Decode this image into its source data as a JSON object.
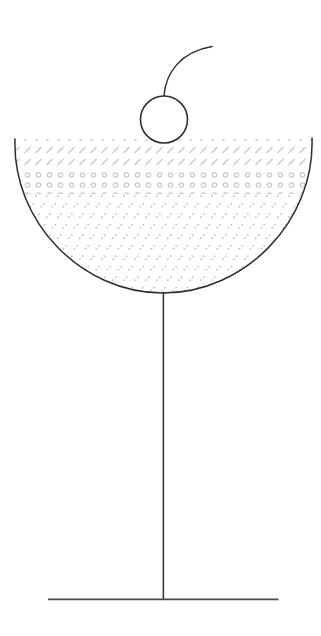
{
  "canvas": {
    "background": "#ffffff",
    "width_px": 321,
    "height_px": 636
  },
  "illustration": {
    "name": "cocktail-coupe-glass-with-cherry",
    "colors": {
      "outline": "#2e2e2e",
      "foot": "#4a4a4a",
      "hatch": "#c6c6c6",
      "cherry_fill": "#ffffff"
    },
    "parts": {
      "cherry": "cherry",
      "cherry_stem": "cherry stem",
      "bowl": "coupe bowl",
      "stem": "glass stem",
      "foot": "glass foot"
    },
    "fill_layers": [
      {
        "name": "top-layer",
        "hatch": "diagonal-slash",
        "rows": 2
      },
      {
        "name": "middle-layer",
        "hatch": "ring-dots",
        "rows": 2
      },
      {
        "name": "bottom-layer",
        "hatch": "speck-pairs",
        "rows": 9
      }
    ]
  }
}
